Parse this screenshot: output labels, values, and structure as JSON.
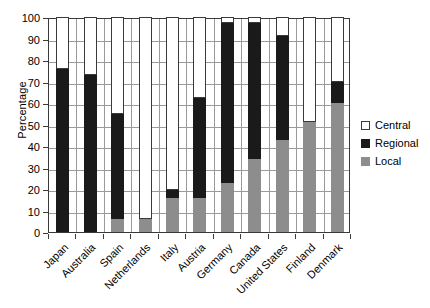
{
  "chart_data": {
    "type": "bar",
    "stacked": true,
    "title": "",
    "xlabel": "",
    "ylabel": "Percentage",
    "ylim": [
      0,
      100
    ],
    "ytick_step": 10,
    "ytick_labels": [
      "0",
      "10",
      "20",
      "30",
      "40",
      "50",
      "60",
      "70",
      "80",
      "90",
      "100"
    ],
    "grid": true,
    "legend_position": "right",
    "categories": [
      "Japan",
      "Australia",
      "Spain",
      "Netherlands",
      "Italy",
      "Austria",
      "Germany",
      "Canada",
      "United States",
      "Finland",
      "Denmark"
    ],
    "series": [
      {
        "name": "Local",
        "color": "#8d8d8d",
        "values": [
          0,
          0,
          6,
          6,
          16,
          16,
          23,
          34,
          43,
          51,
          60
        ]
      },
      {
        "name": "Regional",
        "color": "#1a1a1a",
        "values": [
          76,
          73,
          49,
          0,
          3.5,
          46.5,
          74,
          63,
          48,
          0,
          10
        ]
      },
      {
        "name": "Central",
        "color": "#ffffff",
        "values": [
          24,
          27,
          45,
          94,
          80.5,
          37.5,
          3,
          3,
          9,
          49,
          30
        ]
      }
    ],
    "stack_tops": {
      "local_top": [
        0,
        0,
        6,
        6,
        16,
        16,
        23,
        34,
        43,
        51,
        60
      ],
      "regional_top": [
        76,
        73,
        55,
        6,
        19.5,
        62.5,
        97,
        97,
        91,
        51,
        70
      ]
    },
    "legend": [
      {
        "label": "Central",
        "swatch": "central"
      },
      {
        "label": "Regional",
        "swatch": "regional"
      },
      {
        "label": "Local",
        "swatch": "local"
      }
    ]
  }
}
